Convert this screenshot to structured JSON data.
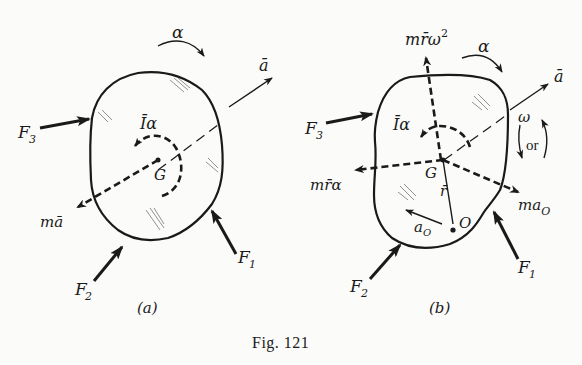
{
  "figure": {
    "caption": "Fig. 121",
    "panel_a": {
      "label": "(a)",
      "alpha": "α",
      "a_bar": "ā",
      "I_alpha": "Īα",
      "G": "G",
      "m_a_bar": "mā",
      "F1": "F",
      "F1_sub": "1",
      "F2": "F",
      "F2_sub": "2",
      "F3": "F",
      "F3_sub": "3"
    },
    "panel_b": {
      "label": "(b)",
      "m_r_omega2": "mr̄ω",
      "m_r_omega2_sup": "2",
      "alpha": "α",
      "a_bar": "ā",
      "omega": "ω",
      "or": "or",
      "I_alpha": "Īα",
      "G": "G",
      "m_r_alpha": "mr̄α",
      "r_bar": "r̄",
      "O": "O",
      "a_O": "a",
      "a_O_sub": "O",
      "m_a_O": "ma",
      "m_a_O_sub": "O",
      "F1": "F",
      "F1_sub": "1",
      "F2": "F",
      "F2_sub": "2",
      "F3": "F",
      "F3_sub": "3"
    }
  }
}
